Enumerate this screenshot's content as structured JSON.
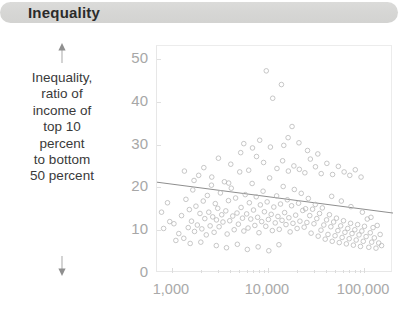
{
  "title": "Inequality",
  "axis": {
    "y_caption_lines": [
      "Inequality,",
      "ratio of",
      "income of",
      "top 10",
      "percent",
      "to bottom",
      "50 percent"
    ],
    "arrow_up": "arrow-up-icon",
    "arrow_down": "arrow-down-icon"
  },
  "chart_data": {
    "type": "scatter",
    "title": "Inequality",
    "xlabel": "",
    "ylabel": "Inequality, ratio of income of top 10 percent to bottom 50 percent",
    "x_scale": "log",
    "xlim": [
      700,
      200000
    ],
    "ylim": [
      0,
      53
    ],
    "xticks": [
      1000,
      10000,
      100000
    ],
    "xtick_labels": [
      "1,000",
      "10,000",
      "100,000"
    ],
    "yticks": [
      0,
      10,
      20,
      30,
      40,
      50
    ],
    "ytick_labels": [
      "0",
      "10",
      "20",
      "30",
      "40",
      "50"
    ],
    "grid": false,
    "legend": null,
    "marker": {
      "shape": "open-circle",
      "color": "#b9b9b9",
      "size": 4.6,
      "linewidth": 0.8
    },
    "trendline": {
      "type": "linear-fit-on-log-x",
      "color": "#8e8e8e",
      "width": 1,
      "x_start": 700,
      "y_start": 21.2,
      "x_end": 200000,
      "y_end": 14.0
    },
    "points": [
      [
        1050,
        11.5
      ],
      [
        1180,
        9.2
      ],
      [
        1260,
        13.4
      ],
      [
        1330,
        8.1
      ],
      [
        1400,
        17.2
      ],
      [
        1480,
        10.6
      ],
      [
        1520,
        14.8
      ],
      [
        1600,
        12.1
      ],
      [
        1650,
        19.4
      ],
      [
        1720,
        9.7
      ],
      [
        1780,
        15.6
      ],
      [
        1840,
        11.2
      ],
      [
        1900,
        22.8
      ],
      [
        1960,
        13.9
      ],
      [
        2050,
        10.3
      ],
      [
        2120,
        16.8
      ],
      [
        2200,
        12.7
      ],
      [
        2280,
        8.9
      ],
      [
        2340,
        18.1
      ],
      [
        2420,
        14.2
      ],
      [
        2500,
        11.0
      ],
      [
        2580,
        20.5
      ],
      [
        2660,
        13.1
      ],
      [
        2750,
        9.5
      ],
      [
        2830,
        16.2
      ],
      [
        2910,
        12.4
      ],
      [
        3000,
        15.1
      ],
      [
        3100,
        10.8
      ],
      [
        3200,
        18.7
      ],
      [
        3300,
        13.6
      ],
      [
        3400,
        11.9
      ],
      [
        3520,
        21.3
      ],
      [
        3640,
        14.5
      ],
      [
        3760,
        9.1
      ],
      [
        3880,
        16.9
      ],
      [
        4000,
        12.2
      ],
      [
        4150,
        19.8
      ],
      [
        4300,
        13.3
      ],
      [
        4450,
        10.1
      ],
      [
        4600,
        17.5
      ],
      [
        4760,
        14.0
      ],
      [
        4920,
        11.4
      ],
      [
        5080,
        23.6
      ],
      [
        5250,
        15.3
      ],
      [
        5430,
        12.8
      ],
      [
        5610,
        9.8
      ],
      [
        5800,
        18.3
      ],
      [
        6000,
        13.8
      ],
      [
        6200,
        10.5
      ],
      [
        6400,
        16.4
      ],
      [
        6620,
        12.6
      ],
      [
        6840,
        20.9
      ],
      [
        7070,
        14.7
      ],
      [
        7300,
        11.1
      ],
      [
        7550,
        17.8
      ],
      [
        7800,
        13.0
      ],
      [
        8060,
        9.4
      ],
      [
        8330,
        15.9
      ],
      [
        8600,
        12.0
      ],
      [
        8890,
        19.1
      ],
      [
        9180,
        14.3
      ],
      [
        9490,
        10.9
      ],
      [
        9800,
        16.6
      ],
      [
        10100,
        12.5
      ],
      [
        10400,
        22.2
      ],
      [
        10800,
        13.7
      ],
      [
        11100,
        9.9
      ],
      [
        11500,
        15.4
      ],
      [
        11900,
        11.7
      ],
      [
        12300,
        18.0
      ],
      [
        12700,
        13.2
      ],
      [
        13100,
        10.2
      ],
      [
        13500,
        16.1
      ],
      [
        14000,
        12.3
      ],
      [
        14400,
        20.2
      ],
      [
        14900,
        14.1
      ],
      [
        15400,
        11.3
      ],
      [
        15900,
        17.1
      ],
      [
        16500,
        12.9
      ],
      [
        17000,
        9.6
      ],
      [
        17600,
        15.7
      ],
      [
        18200,
        11.6
      ],
      [
        18800,
        19.5
      ],
      [
        19400,
        13.5
      ],
      [
        20100,
        10.4
      ],
      [
        20800,
        16.3
      ],
      [
        21500,
        12.1
      ],
      [
        22200,
        18.6
      ],
      [
        23000,
        14.6
      ],
      [
        23800,
        10.7
      ],
      [
        24600,
        15.0
      ],
      [
        25400,
        11.8
      ],
      [
        26300,
        17.4
      ],
      [
        27200,
        13.4
      ],
      [
        28100,
        9.3
      ],
      [
        29100,
        14.9
      ],
      [
        30100,
        11.5
      ],
      [
        31100,
        16.0
      ],
      [
        32200,
        12.7
      ],
      [
        33300,
        8.6
      ],
      [
        34400,
        13.9
      ],
      [
        35600,
        10.0
      ],
      [
        36800,
        15.2
      ],
      [
        38100,
        11.2
      ],
      [
        39400,
        7.9
      ],
      [
        40700,
        12.4
      ],
      [
        42100,
        9.0
      ],
      [
        43600,
        13.6
      ],
      [
        45100,
        10.8
      ],
      [
        46600,
        7.4
      ],
      [
        48200,
        11.9
      ],
      [
        49900,
        8.7
      ],
      [
        51600,
        12.8
      ],
      [
        53400,
        9.9
      ],
      [
        55200,
        7.1
      ],
      [
        57100,
        11.0
      ],
      [
        59100,
        8.3
      ],
      [
        61100,
        12.2
      ],
      [
        63200,
        9.5
      ],
      [
        65400,
        6.8
      ],
      [
        67600,
        10.4
      ],
      [
        70000,
        8.0
      ],
      [
        72400,
        11.6
      ],
      [
        74900,
        9.2
      ],
      [
        77400,
        6.5
      ],
      [
        80100,
        10.1
      ],
      [
        82800,
        7.7
      ],
      [
        85700,
        11.3
      ],
      [
        88600,
        8.9
      ],
      [
        91700,
        6.2
      ],
      [
        94800,
        9.8
      ],
      [
        98100,
        7.4
      ],
      [
        101000,
        10.9
      ],
      [
        105000,
        8.5
      ],
      [
        108000,
        12.6
      ],
      [
        112000,
        6.0
      ],
      [
        116000,
        9.4
      ],
      [
        120000,
        7.2
      ],
      [
        124000,
        10.6
      ],
      [
        128000,
        8.2
      ],
      [
        133000,
        5.8
      ],
      [
        137000,
        11.1
      ],
      [
        142000,
        7.0
      ],
      [
        147000,
        9.0
      ],
      [
        152000,
        6.4
      ],
      [
        2150,
        24.6
      ],
      [
        3050,
        26.8
      ],
      [
        4100,
        25.4
      ],
      [
        5200,
        28.1
      ],
      [
        6300,
        24.0
      ],
      [
        7600,
        27.2
      ],
      [
        9000,
        25.8
      ],
      [
        10600,
        29.4
      ],
      [
        12400,
        24.4
      ],
      [
        14200,
        26.2
      ],
      [
        16300,
        23.8
      ],
      [
        18600,
        25.0
      ],
      [
        21200,
        24.2
      ],
      [
        24200,
        23.4
      ],
      [
        27600,
        26.6
      ],
      [
        31200,
        24.8
      ],
      [
        35800,
        23.2
      ],
      [
        41000,
        25.6
      ],
      [
        47000,
        23.0
      ],
      [
        54000,
        24.9
      ],
      [
        62000,
        23.6
      ],
      [
        71000,
        22.8
      ],
      [
        81000,
        24.1
      ],
      [
        93000,
        22.4
      ],
      [
        9600,
        47.2
      ],
      [
        13800,
        44.0
      ],
      [
        11200,
        40.8
      ],
      [
        17800,
        34.2
      ],
      [
        16200,
        31.6
      ],
      [
        21000,
        30.4
      ],
      [
        14600,
        29.8
      ],
      [
        8200,
        31.0
      ],
      [
        6900,
        29.2
      ],
      [
        25800,
        28.6
      ],
      [
        33000,
        27.8
      ],
      [
        5600,
        30.2
      ],
      [
        1350,
        23.8
      ],
      [
        1700,
        21.6
      ],
      [
        2600,
        22.4
      ],
      [
        3900,
        21.0
      ],
      [
        46000,
        17.9
      ],
      [
        58000,
        16.8
      ],
      [
        73000,
        15.5
      ],
      [
        96000,
        14.2
      ],
      [
        118000,
        13.0
      ],
      [
        1100,
        7.6
      ],
      [
        1550,
        6.9
      ],
      [
        2000,
        7.2
      ],
      [
        2900,
        6.4
      ],
      [
        3700,
        5.9
      ],
      [
        4800,
        6.7
      ],
      [
        6100,
        5.5
      ],
      [
        7900,
        6.1
      ],
      [
        10200,
        5.2
      ],
      [
        13000,
        6.6
      ],
      [
        900,
        16.4
      ],
      [
        950,
        12.0
      ],
      [
        820,
        10.4
      ],
      [
        780,
        14.2
      ]
    ]
  }
}
